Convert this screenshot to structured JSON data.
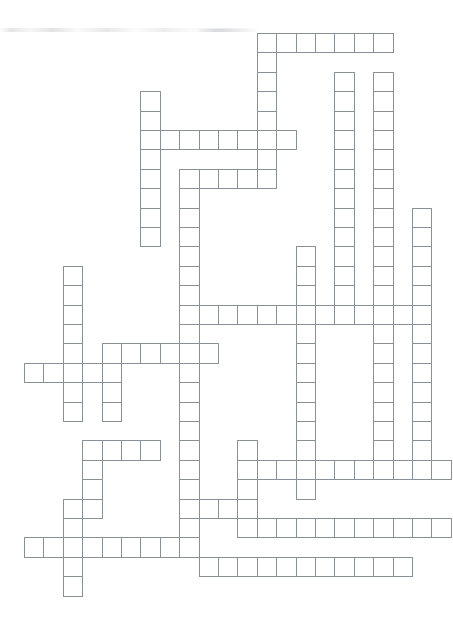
{
  "document": {
    "type": "crossword-puzzle-grid",
    "title": "Blank crossword puzzle grid",
    "description": "Empty interlocking crossword lattice printed on white paper, no clue numbers or letters filled in.",
    "width_px": 453,
    "height_px": 625
  },
  "style": {
    "background_color": "#ffffff",
    "cell_fill_color": "#ffffff",
    "cell_border_color": "#8a8f96",
    "cell_border_width_px": 1
  },
  "grid": {
    "origin_x": 24,
    "origin_y": 33,
    "cell_size": 19.4,
    "columns": 22,
    "rows": 30,
    "filled_cell_count": 216,
    "cells": [
      [
        12,
        0
      ],
      [
        13,
        0
      ],
      [
        14,
        0
      ],
      [
        15,
        0
      ],
      [
        16,
        0
      ],
      [
        17,
        0
      ],
      [
        18,
        0
      ],
      [
        12,
        1
      ],
      [
        12,
        2
      ],
      [
        16,
        2
      ],
      [
        18,
        2
      ],
      [
        6,
        3
      ],
      [
        12,
        3
      ],
      [
        16,
        3
      ],
      [
        18,
        3
      ],
      [
        6,
        4
      ],
      [
        12,
        4
      ],
      [
        16,
        4
      ],
      [
        18,
        4
      ],
      [
        6,
        5
      ],
      [
        7,
        5
      ],
      [
        8,
        5
      ],
      [
        9,
        5
      ],
      [
        10,
        5
      ],
      [
        11,
        5
      ],
      [
        12,
        5
      ],
      [
        13,
        5
      ],
      [
        16,
        5
      ],
      [
        18,
        5
      ],
      [
        6,
        6
      ],
      [
        12,
        6
      ],
      [
        16,
        6
      ],
      [
        18,
        6
      ],
      [
        6,
        7
      ],
      [
        8,
        7
      ],
      [
        9,
        7
      ],
      [
        10,
        7
      ],
      [
        11,
        7
      ],
      [
        12,
        7
      ],
      [
        16,
        7
      ],
      [
        18,
        7
      ],
      [
        6,
        8
      ],
      [
        8,
        8
      ],
      [
        16,
        8
      ],
      [
        18,
        8
      ],
      [
        6,
        9
      ],
      [
        8,
        9
      ],
      [
        16,
        9
      ],
      [
        18,
        9
      ],
      [
        20,
        9
      ],
      [
        6,
        10
      ],
      [
        8,
        10
      ],
      [
        16,
        10
      ],
      [
        18,
        10
      ],
      [
        20,
        10
      ],
      [
        8,
        11
      ],
      [
        14,
        11
      ],
      [
        16,
        11
      ],
      [
        18,
        11
      ],
      [
        20,
        11
      ],
      [
        2,
        12
      ],
      [
        8,
        12
      ],
      [
        14,
        12
      ],
      [
        16,
        12
      ],
      [
        18,
        12
      ],
      [
        20,
        12
      ],
      [
        2,
        13
      ],
      [
        8,
        13
      ],
      [
        14,
        13
      ],
      [
        16,
        13
      ],
      [
        18,
        13
      ],
      [
        20,
        13
      ],
      [
        2,
        14
      ],
      [
        8,
        14
      ],
      [
        9,
        14
      ],
      [
        10,
        14
      ],
      [
        11,
        14
      ],
      [
        12,
        14
      ],
      [
        13,
        14
      ],
      [
        14,
        14
      ],
      [
        15,
        14
      ],
      [
        16,
        14
      ],
      [
        17,
        14
      ],
      [
        18,
        14
      ],
      [
        19,
        14
      ],
      [
        20,
        14
      ],
      [
        2,
        15
      ],
      [
        8,
        15
      ],
      [
        14,
        15
      ],
      [
        18,
        15
      ],
      [
        20,
        15
      ],
      [
        2,
        16
      ],
      [
        4,
        16
      ],
      [
        5,
        16
      ],
      [
        6,
        16
      ],
      [
        7,
        16
      ],
      [
        8,
        16
      ],
      [
        9,
        16
      ],
      [
        14,
        16
      ],
      [
        18,
        16
      ],
      [
        20,
        16
      ],
      [
        0,
        17
      ],
      [
        1,
        17
      ],
      [
        2,
        17
      ],
      [
        3,
        17
      ],
      [
        4,
        17
      ],
      [
        8,
        17
      ],
      [
        14,
        17
      ],
      [
        18,
        17
      ],
      [
        20,
        17
      ],
      [
        2,
        18
      ],
      [
        4,
        18
      ],
      [
        8,
        18
      ],
      [
        14,
        18
      ],
      [
        18,
        18
      ],
      [
        20,
        18
      ],
      [
        2,
        19
      ],
      [
        4,
        19
      ],
      [
        8,
        19
      ],
      [
        14,
        19
      ],
      [
        18,
        19
      ],
      [
        20,
        19
      ],
      [
        8,
        20
      ],
      [
        14,
        20
      ],
      [
        18,
        20
      ],
      [
        20,
        20
      ],
      [
        3,
        21
      ],
      [
        4,
        21
      ],
      [
        5,
        21
      ],
      [
        6,
        21
      ],
      [
        8,
        21
      ],
      [
        11,
        21
      ],
      [
        14,
        21
      ],
      [
        18,
        21
      ],
      [
        20,
        21
      ],
      [
        3,
        22
      ],
      [
        8,
        22
      ],
      [
        11,
        22
      ],
      [
        12,
        22
      ],
      [
        13,
        22
      ],
      [
        14,
        22
      ],
      [
        15,
        22
      ],
      [
        16,
        22
      ],
      [
        17,
        22
      ],
      [
        18,
        22
      ],
      [
        19,
        22
      ],
      [
        20,
        22
      ],
      [
        21,
        22
      ],
      [
        3,
        23
      ],
      [
        8,
        23
      ],
      [
        11,
        23
      ],
      [
        14,
        23
      ],
      [
        2,
        24
      ],
      [
        3,
        24
      ],
      [
        8,
        24
      ],
      [
        9,
        24
      ],
      [
        10,
        24
      ],
      [
        11,
        24
      ],
      [
        2,
        25
      ],
      [
        8,
        25
      ],
      [
        11,
        25
      ],
      [
        12,
        25
      ],
      [
        13,
        25
      ],
      [
        14,
        25
      ],
      [
        15,
        25
      ],
      [
        16,
        25
      ],
      [
        17,
        25
      ],
      [
        18,
        25
      ],
      [
        19,
        25
      ],
      [
        20,
        25
      ],
      [
        21,
        25
      ],
      [
        0,
        26
      ],
      [
        1,
        26
      ],
      [
        2,
        26
      ],
      [
        3,
        26
      ],
      [
        4,
        26
      ],
      [
        5,
        26
      ],
      [
        6,
        26
      ],
      [
        7,
        26
      ],
      [
        8,
        26
      ],
      [
        2,
        27
      ],
      [
        9,
        27
      ],
      [
        10,
        27
      ],
      [
        11,
        27
      ],
      [
        12,
        27
      ],
      [
        13,
        27
      ],
      [
        14,
        27
      ],
      [
        15,
        27
      ],
      [
        16,
        27
      ],
      [
        17,
        27
      ],
      [
        18,
        27
      ],
      [
        19,
        27
      ],
      [
        2,
        28
      ]
    ]
  }
}
